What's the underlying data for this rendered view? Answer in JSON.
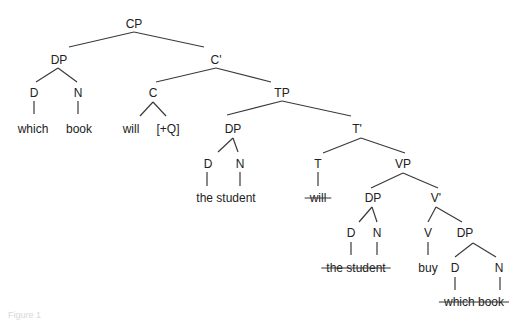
{
  "diagram": {
    "type": "syntax-tree",
    "nodes": [
      {
        "id": "cp",
        "label": "CP",
        "x": 134,
        "y": 28
      },
      {
        "id": "dp1",
        "label": "DP",
        "x": 59,
        "y": 64
      },
      {
        "id": "cbar",
        "label": "C'",
        "x": 216,
        "y": 64
      },
      {
        "id": "d1",
        "label": "D",
        "x": 34,
        "y": 97
      },
      {
        "id": "n1",
        "label": "N",
        "x": 78,
        "y": 97
      },
      {
        "id": "c",
        "label": "C",
        "x": 153,
        "y": 97
      },
      {
        "id": "tp",
        "label": "TP",
        "x": 282,
        "y": 97
      },
      {
        "id": "dp2",
        "label": "DP",
        "x": 233,
        "y": 133
      },
      {
        "id": "tbar",
        "label": "T'",
        "x": 357,
        "y": 133
      },
      {
        "id": "d2",
        "label": "D",
        "x": 208,
        "y": 168
      },
      {
        "id": "n2",
        "label": "N",
        "x": 240,
        "y": 168
      },
      {
        "id": "t",
        "label": "T",
        "x": 318,
        "y": 168
      },
      {
        "id": "vp",
        "label": "VP",
        "x": 403,
        "y": 168
      },
      {
        "id": "dp3",
        "label": "DP",
        "x": 373,
        "y": 202
      },
      {
        "id": "vbar",
        "label": "V'",
        "x": 436,
        "y": 202
      },
      {
        "id": "d3",
        "label": "D",
        "x": 351,
        "y": 237
      },
      {
        "id": "n3",
        "label": "N",
        "x": 377,
        "y": 237
      },
      {
        "id": "v",
        "label": "V",
        "x": 428,
        "y": 237
      },
      {
        "id": "dp4",
        "label": "DP",
        "x": 465,
        "y": 237
      },
      {
        "id": "d4",
        "label": "D",
        "x": 455,
        "y": 272
      },
      {
        "id": "n4",
        "label": "N",
        "x": 499,
        "y": 272
      }
    ],
    "leaves": [
      {
        "id": "which",
        "text": "which",
        "x": 33,
        "y": 133,
        "struck": false
      },
      {
        "id": "book",
        "text": "book",
        "x": 79,
        "y": 133,
        "struck": false
      },
      {
        "id": "will",
        "text": "will",
        "x": 131,
        "y": 133,
        "struck": false
      },
      {
        "id": "q",
        "text": "[+Q]",
        "x": 168,
        "y": 133,
        "struck": false
      },
      {
        "id": "the-student",
        "text": "the student",
        "x": 226,
        "y": 202,
        "struck": false
      },
      {
        "id": "will-trace",
        "text": "will",
        "x": 318,
        "y": 202,
        "struck": true
      },
      {
        "id": "the-student-trace",
        "text": "the student",
        "x": 356,
        "y": 272,
        "struck": true
      },
      {
        "id": "buy",
        "text": "buy",
        "x": 428,
        "y": 272,
        "struck": false
      },
      {
        "id": "which-book-trace",
        "text": "which book",
        "x": 474,
        "y": 306,
        "struck": true
      }
    ],
    "edges": [
      [
        134,
        32,
        69,
        47
      ],
      [
        134,
        32,
        204,
        47
      ],
      [
        58,
        68,
        36,
        82
      ],
      [
        58,
        68,
        77,
        82
      ],
      [
        216,
        68,
        156,
        82
      ],
      [
        216,
        68,
        271,
        82
      ],
      [
        34,
        101,
        34,
        114
      ],
      [
        78,
        101,
        78,
        114
      ],
      [
        153,
        102,
        140,
        116
      ],
      [
        153,
        102,
        166,
        116
      ],
      [
        282,
        101,
        227,
        115
      ],
      [
        282,
        101,
        351,
        116
      ],
      [
        233,
        138,
        218,
        152
      ],
      [
        233,
        138,
        238,
        152
      ],
      [
        361,
        138,
        323,
        153
      ],
      [
        361,
        138,
        405,
        153
      ],
      [
        207,
        172,
        207,
        186
      ],
      [
        240,
        172,
        240,
        186
      ],
      [
        318,
        172,
        318,
        186
      ],
      [
        403,
        173,
        371,
        188
      ],
      [
        403,
        173,
        438,
        188
      ],
      [
        372,
        207,
        359,
        222
      ],
      [
        372,
        207,
        377,
        222
      ],
      [
        436,
        207,
        428,
        222
      ],
      [
        436,
        207,
        462,
        222
      ],
      [
        351,
        242,
        351,
        255
      ],
      [
        377,
        242,
        377,
        255
      ],
      [
        428,
        242,
        428,
        255
      ],
      [
        473,
        243,
        455,
        257
      ],
      [
        473,
        243,
        496,
        257
      ],
      [
        455,
        277,
        455,
        290
      ],
      [
        500,
        277,
        500,
        290
      ]
    ]
  },
  "caption": {
    "text": "Figure 1"
  }
}
